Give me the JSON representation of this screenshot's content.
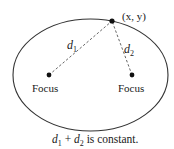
{
  "diagram": {
    "type": "ellipse-foci",
    "ellipse": {
      "cx": 90.5,
      "cy": 75,
      "rx": 77.5,
      "ry": 56,
      "stroke": "#333333"
    },
    "point": {
      "x": 112,
      "y": 21,
      "label": "(x, y)"
    },
    "foci": [
      {
        "x": 49,
        "y": 75,
        "label": "Focus"
      },
      {
        "x": 132,
        "y": 75,
        "label": "Focus"
      }
    ],
    "distances": [
      {
        "var": "d",
        "sub": "1"
      },
      {
        "var": "d",
        "sub": "2"
      }
    ],
    "caption": {
      "d1_var": "d",
      "d1_sub": "1",
      "plus": " + ",
      "d2_var": "d",
      "d2_sub": "2",
      "text": " is constant."
    }
  }
}
